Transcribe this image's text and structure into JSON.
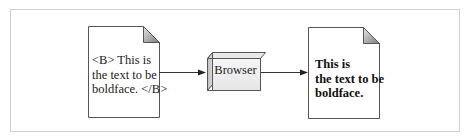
{
  "diagram": {
    "source_document": {
      "lines": [
        "<B> This is",
        "the text to be",
        "boldface. </B>"
      ]
    },
    "processor": {
      "label": "Browser"
    },
    "output_document": {
      "lines": [
        "This is",
        "the text to be",
        "boldface."
      ]
    },
    "colors": {
      "frame": "#cfcfcf",
      "stroke": "#555555",
      "fold_dark": "#8a8a8a",
      "fold_light": "#e4e4e4",
      "box_face": "#f2f2f2",
      "box_side": "#c8c8c8"
    }
  }
}
